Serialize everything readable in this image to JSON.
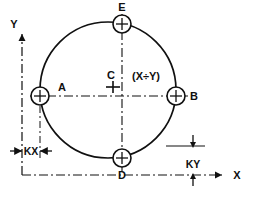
{
  "diagram": {
    "colors": {
      "line": "#101010",
      "background": "#ffffff"
    },
    "axes": {
      "x_label": "X",
      "y_label": "Y",
      "x_line_style": "dash-dot",
      "y_line_style": "dash-dot"
    },
    "center": {
      "label": "C",
      "coordinate_label": "(X÷Y)",
      "marker": "crosshair"
    },
    "circle": {
      "style": "solid",
      "center_x": 108,
      "center_y": 90,
      "radius": 68
    },
    "holes": [
      {
        "label": "A",
        "position": "left",
        "cx": 40,
        "cy": 96,
        "r": 9
      },
      {
        "label": "B",
        "position": "right",
        "cx": 176,
        "cy": 96,
        "r": 9
      },
      {
        "label": "D",
        "position": "bottom",
        "cx": 122,
        "cy": 158,
        "r": 9
      },
      {
        "label": "E",
        "position": "top",
        "cx": 122,
        "cy": 24,
        "r": 9
      }
    ],
    "dimensions": [
      {
        "label": "KX",
        "orientation": "horizontal",
        "location": "bottom-left"
      },
      {
        "label": "KY",
        "orientation": "vertical",
        "location": "bottom-right"
      }
    ]
  }
}
